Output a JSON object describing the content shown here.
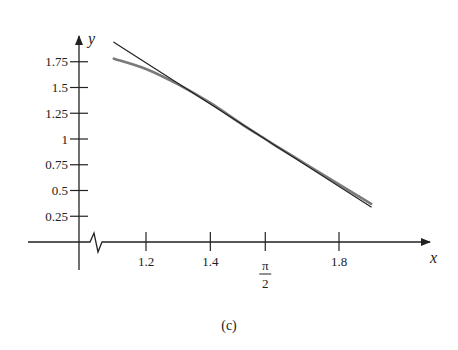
{
  "chart_data": {
    "type": "line",
    "title": "",
    "caption": "(c)",
    "xlabel": "x",
    "ylabel": "y",
    "xlim": [
      0.95,
      2.05
    ],
    "ylim": [
      0,
      1.9
    ],
    "grid": false,
    "x_axis_break": true,
    "x_ticks": [
      {
        "value": 1.2,
        "label": "1.2"
      },
      {
        "value": 1.4,
        "label": "1.4"
      },
      {
        "value": 1.5708,
        "label": "π/2",
        "numerator": "π",
        "denominator": "2"
      },
      {
        "value": 1.8,
        "label": "1.8"
      }
    ],
    "y_ticks": [
      {
        "value": 0.25,
        "label": "0.25"
      },
      {
        "value": 0.5,
        "label": "0.5"
      },
      {
        "value": 0.75,
        "label": "0.75"
      },
      {
        "value": 1,
        "label": "1"
      },
      {
        "value": 1.25,
        "label": "1.25"
      },
      {
        "value": 1.5,
        "label": "1.5"
      },
      {
        "value": 1.75,
        "label": "1.75"
      }
    ],
    "series": [
      {
        "name": "curve",
        "color": "#7a7a7a",
        "x": [
          1.1,
          1.2,
          1.3,
          1.4,
          1.5,
          1.5708,
          1.6,
          1.7,
          1.8,
          1.9
        ],
        "y": [
          1.78,
          1.68,
          1.53,
          1.35,
          1.14,
          1.0,
          0.94,
          0.75,
          0.56,
          0.37
        ]
      },
      {
        "name": "tangent-line",
        "color": "#222222",
        "x": [
          1.1,
          1.9
        ],
        "y": [
          1.94,
          0.34
        ]
      }
    ]
  }
}
